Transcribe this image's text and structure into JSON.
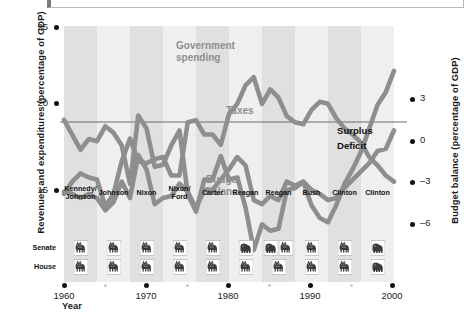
{
  "chart_data": {
    "type": "line",
    "title": "",
    "xlabel": "Year",
    "ylabel": "Revenues and expenditures (percentage of GDP)",
    "ylabel_right": "Budget balance (percentage of GDP)",
    "xlim": [
      1960,
      2000
    ],
    "ylim_left": [
      13.5,
      26.0
    ],
    "ylim_right": [
      -7.5,
      4.5
    ],
    "grid": false,
    "legend_position": "inline-annotations",
    "xticks": [
      1960,
      1970,
      1980,
      1990,
      2000
    ],
    "xticks_minor": [
      1965,
      1975,
      1985,
      1995
    ],
    "yticks_left": [
      15,
      20,
      25
    ],
    "yticks_right": [
      -6,
      -3,
      0,
      3
    ],
    "x": [
      1960,
      1961,
      1962,
      1963,
      1964,
      1965,
      1966,
      1967,
      1968,
      1969,
      1970,
      1971,
      1972,
      1973,
      1974,
      1975,
      1976,
      1977,
      1978,
      1979,
      1980,
      1981,
      1982,
      1983,
      1984,
      1985,
      1986,
      1987,
      1988,
      1989,
      1990,
      1991,
      1992,
      1993,
      1994,
      1995,
      1996,
      1997,
      1998,
      1999,
      2000
    ],
    "series": [
      {
        "name": "Government spending",
        "axis": "left",
        "color": "#8e8e8e",
        "values": [
          17.8,
          18.4,
          18.8,
          18.6,
          18.5,
          17.2,
          17.8,
          19.4,
          20.5,
          19.4,
          19.3,
          19.5,
          19.6,
          18.7,
          18.7,
          21.3,
          21.4,
          20.7,
          20.7,
          20.2,
          21.7,
          22.2,
          23.1,
          23.5,
          22.2,
          22.9,
          22.5,
          21.6,
          21.3,
          21.2,
          21.9,
          22.3,
          22.2,
          21.5,
          21.0,
          20.7,
          20.3,
          19.6,
          19.2,
          18.7,
          18.4
        ]
      },
      {
        "name": "Taxes",
        "axis": "left",
        "color": "#8e8e8e",
        "values": [
          17.9,
          17.8,
          17.6,
          17.8,
          17.6,
          17.0,
          17.4,
          18.4,
          17.6,
          19.7,
          19.0,
          17.3,
          17.6,
          17.7,
          18.3,
          17.9,
          17.1,
          18.0,
          18.0,
          18.5,
          19.0,
          19.6,
          19.2,
          17.5,
          17.3,
          17.7,
          17.5,
          18.4,
          18.2,
          18.4,
          18.0,
          17.8,
          17.5,
          17.6,
          18.1,
          18.5,
          18.9,
          19.3,
          19.9,
          20.0,
          20.9
        ]
      },
      {
        "name": "Budget balance",
        "axis": "right",
        "color": "#8e8e8e",
        "values": [
          0.1,
          -0.6,
          -1.3,
          -0.8,
          -0.9,
          -0.2,
          -0.5,
          -1.1,
          -2.9,
          0.3,
          -0.3,
          -2.1,
          -2.0,
          -1.1,
          -0.4,
          -3.4,
          -4.2,
          -2.7,
          -2.7,
          -1.6,
          -2.7,
          -2.6,
          -4.0,
          -6.0,
          -4.8,
          -5.1,
          -5.0,
          -3.2,
          -3.1,
          -2.8,
          -3.9,
          -4.5,
          -4.7,
          -3.9,
          -2.9,
          -2.2,
          -1.4,
          -0.3,
          0.8,
          1.4,
          2.4
        ]
      }
    ],
    "annotations": [
      {
        "text": "Government\nspending",
        "series": "Government spending"
      },
      {
        "text": "Taxes",
        "series": "Taxes"
      },
      {
        "text": "Budget\nbalance",
        "series": "Budget balance"
      },
      {
        "text": "Surplus",
        "note": "above zero line on right axis"
      },
      {
        "text": "Deficit",
        "note": "below zero line on right axis"
      }
    ]
  },
  "axes": {
    "left_title": "Revenues and expenditures (percentage of GDP)",
    "right_title": "Budget balance (percentage of GDP)",
    "x_title": "Year",
    "left_ticks": [
      "25",
      "20",
      "15"
    ],
    "right_ticks": [
      "3",
      "0",
      "–3",
      "–6"
    ],
    "x_ticks": [
      "1960",
      "1970",
      "1980",
      "1990",
      "2000"
    ]
  },
  "series_labels": {
    "government_spending": "Government\nspending",
    "taxes": "Taxes",
    "budget_balance": "Budget\nbalance",
    "surplus": "Surplus",
    "deficit": "Deficit"
  },
  "congress": {
    "row_labels": {
      "senate": "Senate",
      "house": "House"
    },
    "periods": [
      {
        "president": "Kennedy/\nJohnson",
        "senate": [
          "democrat"
        ],
        "house": [
          "democrat"
        ]
      },
      {
        "president": "Johnson",
        "senate": [
          "democrat"
        ],
        "house": [
          "democrat"
        ]
      },
      {
        "president": "Nixon",
        "senate": [
          "democrat"
        ],
        "house": [
          "democrat"
        ]
      },
      {
        "president": "Nixon/\nFord",
        "senate": [
          "democrat"
        ],
        "house": [
          "democrat"
        ]
      },
      {
        "president": "Carter",
        "senate": [
          "democrat"
        ],
        "house": [
          "democrat"
        ]
      },
      {
        "president": "Reagan",
        "senate": [
          "republican"
        ],
        "house": [
          "democrat"
        ]
      },
      {
        "president": "Reagan",
        "senate": [
          "republican",
          "democrat"
        ],
        "house": [
          "democrat"
        ]
      },
      {
        "president": "Bush",
        "senate": [
          "democrat"
        ],
        "house": [
          "democrat"
        ]
      },
      {
        "president": "Clinton",
        "senate": [
          "democrat"
        ],
        "house": [
          "democrat"
        ]
      },
      {
        "president": "Clinton",
        "senate": [
          "republican"
        ],
        "house": [
          "republican"
        ]
      }
    ]
  },
  "colors": {
    "series_line": "#8e8e8e",
    "band_dark": "#e0e0e0",
    "band_light": "#efefef",
    "zero_line": "#666666",
    "text": "#111111",
    "tick_dot": "#111111",
    "tick_dot_minor": "#c9c9c9"
  }
}
